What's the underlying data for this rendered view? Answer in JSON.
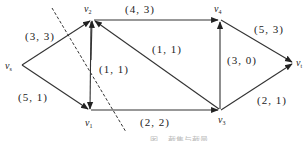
{
  "diagram": {
    "type": "flow-network",
    "nodes": [
      {
        "id": "vs",
        "label": "v",
        "sub": "s",
        "x": 22,
        "y": 65
      },
      {
        "id": "v2",
        "label": "v",
        "sub": "2",
        "x": 92,
        "y": 20
      },
      {
        "id": "v1",
        "label": "v",
        "sub": "1",
        "x": 90,
        "y": 110
      },
      {
        "id": "v4",
        "label": "v",
        "sub": "4",
        "x": 220,
        "y": 20
      },
      {
        "id": "v3",
        "label": "v",
        "sub": "3",
        "x": 220,
        "y": 110
      },
      {
        "id": "vt",
        "label": "v",
        "sub": "t",
        "x": 294,
        "y": 63
      }
    ],
    "edges": [
      {
        "from": "vs",
        "to": "v2",
        "label": "(3, 3)"
      },
      {
        "from": "vs",
        "to": "v1",
        "label": "(5, 1)"
      },
      {
        "from": "v2",
        "to": "v1",
        "label": "(1, 1)"
      },
      {
        "from": "v2",
        "to": "v4",
        "label": "(4, 3)"
      },
      {
        "from": "v3",
        "to": "v2",
        "label": "(1, 1)"
      },
      {
        "from": "v1",
        "to": "v3",
        "label": "(2, 2)"
      },
      {
        "from": "v3",
        "to": "v4",
        "label": "(3, 0)"
      },
      {
        "from": "v4",
        "to": "vt",
        "label": "(5, 3)"
      },
      {
        "from": "v3",
        "to": "vt",
        "label": "(2, 1)"
      }
    ],
    "cut_line": {
      "style": "dashed",
      "x1": 52,
      "y1": 8,
      "x2": 126,
      "y2": 132
    },
    "caption": "图 ... 截集与截量"
  }
}
